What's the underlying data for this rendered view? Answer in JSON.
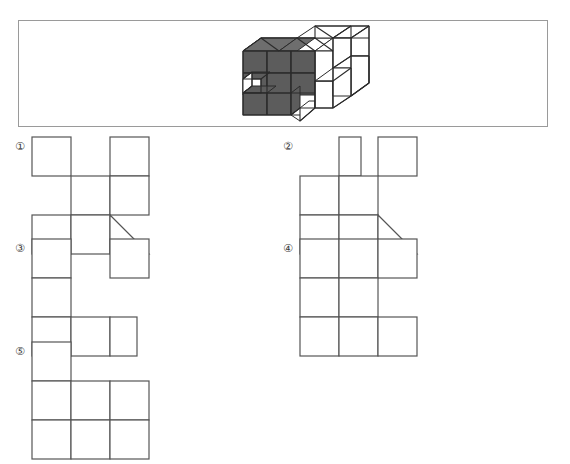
{
  "page": {
    "kind": "multiple-choice-figure-question",
    "background_color": "#ffffff"
  },
  "question_frame": {
    "border_color": "#9a9a9a",
    "figure": {
      "name": "3d-cube-solid",
      "description": "Isometric solid built from unit cubes, front-left faces shaded dark gray, right/top faces white",
      "shaded_color": "#5c5c5c",
      "shaded_top_color": "#6e6e6e",
      "white_color": "#ffffff",
      "outline_color": "#2b2b2b"
    }
  },
  "options": [
    {
      "id": "1",
      "label": "①",
      "cell_size": 39,
      "cells": [
        {
          "col": 0,
          "row": 0
        },
        {
          "col": 2,
          "row": 0
        },
        {
          "col": 1,
          "row": 1
        },
        {
          "col": 2,
          "row": 1
        },
        {
          "col": 0,
          "row": 2
        },
        {
          "col": 1,
          "row": 2
        }
      ],
      "triangle": {
        "col": 2,
        "row": 2,
        "orientation": "lower-right"
      },
      "has_triangle": true
    },
    {
      "id": "2",
      "label": "②",
      "cell_size": 39,
      "cells": [
        {
          "col": 1,
          "row": 0,
          "half": "narrow"
        },
        {
          "col": 2,
          "row": 0
        },
        {
          "col": 0,
          "row": 1
        },
        {
          "col": 1,
          "row": 1
        },
        {
          "col": 0,
          "row": 2
        },
        {
          "col": 1,
          "row": 2
        }
      ],
      "triangle": {
        "col": 2,
        "row": 2,
        "orientation": "lower-right"
      },
      "has_triangle": true
    },
    {
      "id": "3",
      "label": "③",
      "cell_size": 39,
      "cells": [
        {
          "col": 0,
          "row": 0
        },
        {
          "col": 2,
          "row": 0
        },
        {
          "col": 0,
          "row": 1
        },
        {
          "col": 0,
          "row": 2
        },
        {
          "col": 1,
          "row": 2
        },
        {
          "col": 2,
          "row": 2
        }
      ],
      "has_triangle": false
    },
    {
      "id": "4",
      "label": "④",
      "cell_size": 39,
      "cells": [
        {
          "col": 0,
          "row": 0
        },
        {
          "col": 1,
          "row": 0
        },
        {
          "col": 2,
          "row": 0
        },
        {
          "col": 0,
          "row": 1
        },
        {
          "col": 1,
          "row": 1
        },
        {
          "col": 0,
          "row": 2
        },
        {
          "col": 1,
          "row": 2
        },
        {
          "col": 2,
          "row": 2
        }
      ],
      "has_triangle": false
    },
    {
      "id": "5",
      "label": "⑤",
      "cell_size": 39,
      "cells": [
        {
          "col": 0,
          "row": 0
        },
        {
          "col": 0,
          "row": 1
        },
        {
          "col": 1,
          "row": 1
        },
        {
          "col": 2,
          "row": 1
        },
        {
          "col": 0,
          "row": 2
        },
        {
          "col": 1,
          "row": 2
        },
        {
          "col": 2,
          "row": 2
        }
      ],
      "has_triangle": false
    }
  ],
  "style": {
    "net_stroke_color": "#555555",
    "net_stroke_width": 1.2,
    "label_color": "#3a3a3a"
  }
}
